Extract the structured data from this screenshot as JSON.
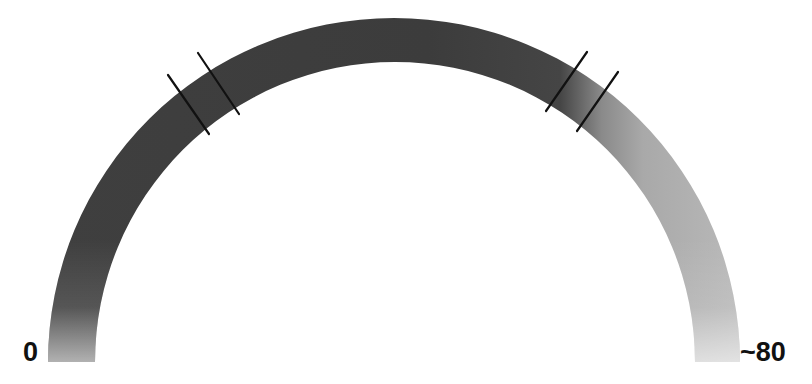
{
  "diagram": {
    "type": "semicircular-gauge-band",
    "labels": {
      "start": "0",
      "end": "~80"
    },
    "colors": {
      "band_dark": "#3c3c3c",
      "band_mid": "#6a6a6a",
      "band_light": "#b4b4b4",
      "band_foot_left": "#bdbdbd",
      "band_foot_right": "#cfcfcf",
      "tick": "#111111",
      "background": "#ffffff",
      "label": "#111111"
    },
    "tick_pairs": [
      {
        "name": "left-tick-pair",
        "position": "upper-left of arc"
      },
      {
        "name": "right-tick-pair",
        "position": "upper-right of arc, at dark-to-light transition"
      }
    ]
  }
}
